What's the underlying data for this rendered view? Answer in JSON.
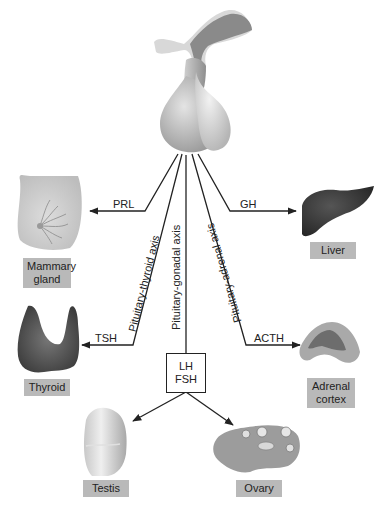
{
  "diagram": {
    "center": "pituitary-gland",
    "axes": {
      "thyroid": "Pituitary-thyroid axis",
      "gonadal": "Pituitary-gonadal axis",
      "adrenal": "Pituitary-adrenal axis"
    },
    "hormones": {
      "prl": "PRL",
      "gh": "GH",
      "tsh": "TSH",
      "acth": "ACTH",
      "lh": "LH",
      "fsh": "FSH"
    },
    "organs": {
      "mammary_line1": "Mammary",
      "mammary_line2": "gland",
      "liver": "Liver",
      "thyroid": "Thyroid",
      "adrenal_line1": "Adrenal",
      "adrenal_line2": "cortex",
      "testis": "Testis",
      "ovary": "Ovary"
    },
    "colors": {
      "label_bg": "#b9b9b9",
      "line": "#222222",
      "liver": "#3a3a3a",
      "thyroid": "#4a4a4a"
    }
  }
}
